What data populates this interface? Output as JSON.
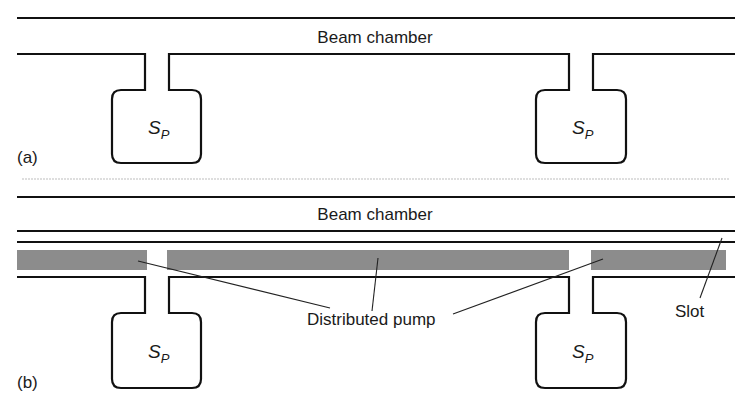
{
  "figure": {
    "panels": [
      {
        "id": "a",
        "panel_label": "(a)",
        "chamber_label": "Beam chamber",
        "pumps": [
          {
            "label_main": "S",
            "label_sub": "P"
          },
          {
            "label_main": "S",
            "label_sub": "P"
          }
        ]
      },
      {
        "id": "b",
        "panel_label": "(b)",
        "chamber_label": "Beam chamber",
        "distributed_pump_label": "Distributed pump",
        "slot_label": "Slot",
        "pumps": [
          {
            "label_main": "S",
            "label_sub": "P"
          },
          {
            "label_main": "S",
            "label_sub": "P"
          }
        ]
      }
    ],
    "colors": {
      "wall": "#111111",
      "distributed_pump_fill": "#8c8c8c",
      "separator": "#bdbdbd",
      "background": "#ffffff"
    }
  }
}
